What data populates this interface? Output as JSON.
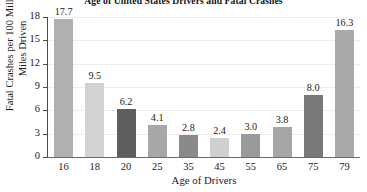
{
  "chart_data": {
    "type": "bar",
    "title": "Age of United States Drivers and Fatal Crashes",
    "xlabel": "Age of Drivers",
    "ylabel_line1": "Fatal Crashes per 100 Million",
    "ylabel_line2": "Miles Driven",
    "categories": [
      "16",
      "18",
      "20",
      "25",
      "35",
      "45",
      "55",
      "65",
      "75",
      "79"
    ],
    "values": [
      17.7,
      9.5,
      6.2,
      4.1,
      2.8,
      2.4,
      3.0,
      3.8,
      8.0,
      16.3
    ],
    "value_labels": [
      "17.7",
      "9.5",
      "6.2",
      "4.1",
      "2.8",
      "2.4",
      "3.0",
      "3.8",
      "8.0",
      "16.3"
    ],
    "bar_colors": [
      "#b0b0b0",
      "#d2d2d2",
      "#5e5e5e",
      "#a8a8a8",
      "#8a8a8a",
      "#cfcfcf",
      "#9a9a9a",
      "#a5a5a5",
      "#787878",
      "#a9a9a9"
    ],
    "ylim": [
      0,
      18
    ],
    "ytick_values": [
      0,
      3,
      6,
      9,
      12,
      15,
      18
    ],
    "ytick_labels": [
      "0",
      "3",
      "6",
      "9",
      "12",
      "15",
      "18"
    ],
    "grid": true,
    "grid_color": "#ededed",
    "legend": null,
    "axis_color": "#4a4a4a"
  }
}
